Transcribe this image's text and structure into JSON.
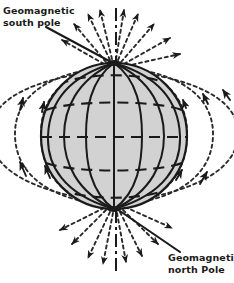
{
  "figure": {
    "background_color": "#ffffff",
    "ink_color": "#1a1a1a",
    "globe_fill_color": "#d2d2d2"
  },
  "labels": {
    "south_pole": "Geomagnetic\nsouth pole",
    "north_pole": "Geomagnetic\nnorth Pole"
  },
  "globe": {
    "center_x": 114,
    "center_y": 136,
    "radius": 73,
    "meridian_count": 8,
    "parallel_count": 7,
    "axis_tilt_deg": 0,
    "meridian_style": "solid",
    "parallel_style": "dashed",
    "pole_north_x": 114,
    "pole_north_y": 209,
    "pole_south_x": 114,
    "pole_south_y": 63
  },
  "field_lines": {
    "style": "dashed",
    "arrow_direction": "toward-geomagnetic-south-pole",
    "loop_count_per_side": 5,
    "loop_spreads": [
      40,
      78,
      120,
      168,
      225
    ],
    "polar_ray_count": 14
  },
  "leader_lines": {
    "south": {
      "x1": 46,
      "y1": 27,
      "x2": 112,
      "y2": 64
    },
    "north": {
      "x1": 116,
      "y1": 208,
      "x2": 180,
      "y2": 252
    }
  },
  "axis_line": {
    "style": "dash-dot",
    "top_y": 8,
    "bottom_y": 272,
    "x": 116
  }
}
